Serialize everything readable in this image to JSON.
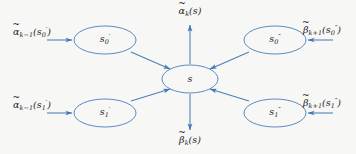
{
  "figure": {
    "type": "diagram",
    "background_color": "#f7f7f5",
    "stroke_color": "#4a7ebb",
    "text_color": "#1c1c1c"
  },
  "nodes": [
    {
      "id": "s0p",
      "label_base": "s",
      "label_sub": "0",
      "label_sup": "′",
      "cx": 105,
      "cy": 40,
      "rx": 31,
      "ry": 14
    },
    {
      "id": "s1p",
      "label_base": "s",
      "label_sub": "1",
      "label_sup": "′",
      "cx": 105,
      "cy": 113,
      "rx": 31,
      "ry": 14
    },
    {
      "id": "s",
      "label_base": "s",
      "label_sub": "",
      "label_sup": "",
      "cx": 190,
      "cy": 79,
      "rx": 28,
      "ry": 14
    },
    {
      "id": "s0pp",
      "label_base": "s",
      "label_sub": "0",
      "label_sup": "″",
      "cx": 275,
      "cy": 40,
      "rx": 31,
      "ry": 14
    },
    {
      "id": "s1pp",
      "label_base": "s",
      "label_sub": "1",
      "label_sup": "″",
      "cx": 275,
      "cy": 113,
      "rx": 31,
      "ry": 14
    }
  ],
  "edge_labels": [
    {
      "id": "alpha-k-1-s0p",
      "greek": "α",
      "tilde": "~",
      "sub": "k−1",
      "arg_base": "s",
      "arg_sub": "0",
      "arg_sup": "′",
      "x": 32,
      "y": 33
    },
    {
      "id": "alpha-k-1-s1p",
      "greek": "α",
      "tilde": "~",
      "sub": "k−1",
      "arg_base": "s",
      "arg_sub": "1",
      "arg_sup": "′",
      "x": 32,
      "y": 106
    },
    {
      "id": "alpha-k-s",
      "greek": "α",
      "tilde": "~",
      "sub": "k",
      "arg_base": "s",
      "arg_sub": "",
      "arg_sup": "",
      "x": 190,
      "y": 12
    },
    {
      "id": "beta-k-s",
      "greek": "β",
      "tilde": "~",
      "sub": "k",
      "arg_base": "s",
      "arg_sub": "",
      "arg_sup": "",
      "x": 190,
      "y": 141
    },
    {
      "id": "beta-k+1-s0pp",
      "greek": "β",
      "tilde": "~",
      "sub": "k+1",
      "arg_base": "s",
      "arg_sub": "0",
      "arg_sup": "″",
      "x": 322,
      "y": 31
    },
    {
      "id": "beta-k+1-s1pp",
      "greek": "β",
      "tilde": "~",
      "sub": "k+1",
      "arg_base": "s",
      "arg_sub": "1",
      "arg_sup": "″",
      "x": 322,
      "y": 104
    }
  ],
  "arrows": [
    {
      "id": "in-alpha-s0p",
      "from": [
        47,
        40
      ],
      "to": [
        72,
        40
      ],
      "direction": "right"
    },
    {
      "id": "in-alpha-s1p",
      "from": [
        47,
        113
      ],
      "to": [
        72,
        113
      ],
      "direction": "right"
    },
    {
      "id": "s0p-to-s",
      "from": [
        131,
        52
      ],
      "to": [
        169,
        69
      ],
      "direction": "down-right"
    },
    {
      "id": "s1p-to-s",
      "from": [
        131,
        101
      ],
      "to": [
        169,
        89
      ],
      "direction": "up-right"
    },
    {
      "id": "s0pp-to-s",
      "from": [
        249,
        52
      ],
      "to": [
        211,
        69
      ],
      "direction": "down-left"
    },
    {
      "id": "s1pp-to-s",
      "from": [
        249,
        101
      ],
      "to": [
        211,
        89
      ],
      "direction": "up-left"
    },
    {
      "id": "s-to-alpha-k",
      "from": [
        190,
        64
      ],
      "to": [
        190,
        24
      ],
      "direction": "up"
    },
    {
      "id": "s-to-beta-k",
      "from": [
        190,
        94
      ],
      "to": [
        190,
        130
      ],
      "direction": "down"
    },
    {
      "id": "in-beta-s0pp",
      "from": [
        333,
        40
      ],
      "to": [
        308,
        40
      ],
      "direction": "left"
    },
    {
      "id": "in-beta-s1pp",
      "from": [
        333,
        113
      ],
      "to": [
        308,
        113
      ],
      "direction": "left"
    }
  ]
}
